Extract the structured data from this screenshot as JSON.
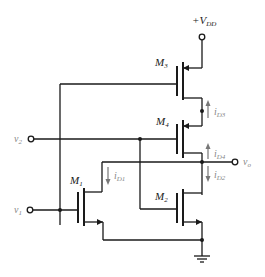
{
  "diagram": {
    "type": "circuit-schematic",
    "supply": {
      "label": "+V",
      "subscript": "DD"
    },
    "transistors": [
      {
        "id": "M3",
        "label": "M",
        "subscript": "3",
        "type": "PMOS"
      },
      {
        "id": "M4",
        "label": "M",
        "subscript": "4",
        "type": "PMOS"
      },
      {
        "id": "M1",
        "label": "M",
        "subscript": "1",
        "type": "NMOS"
      },
      {
        "id": "M2",
        "label": "M",
        "subscript": "2",
        "type": "NMOS"
      }
    ],
    "inputs": [
      {
        "id": "v2",
        "label": "v",
        "subscript": "2"
      },
      {
        "id": "v1",
        "label": "v",
        "subscript": "1"
      }
    ],
    "output": {
      "id": "vo",
      "label": "v",
      "subscript": "o"
    },
    "currents": [
      {
        "id": "iD3",
        "label": "i",
        "subscript": "D3",
        "direction": "up"
      },
      {
        "id": "iD4",
        "label": "i",
        "subscript": "D4",
        "direction": "up"
      },
      {
        "id": "iD2",
        "label": "i",
        "subscript": "D2",
        "direction": "down"
      },
      {
        "id": "iD1",
        "label": "i",
        "subscript": "D1",
        "direction": "down"
      }
    ],
    "ground": "ground-symbol"
  }
}
